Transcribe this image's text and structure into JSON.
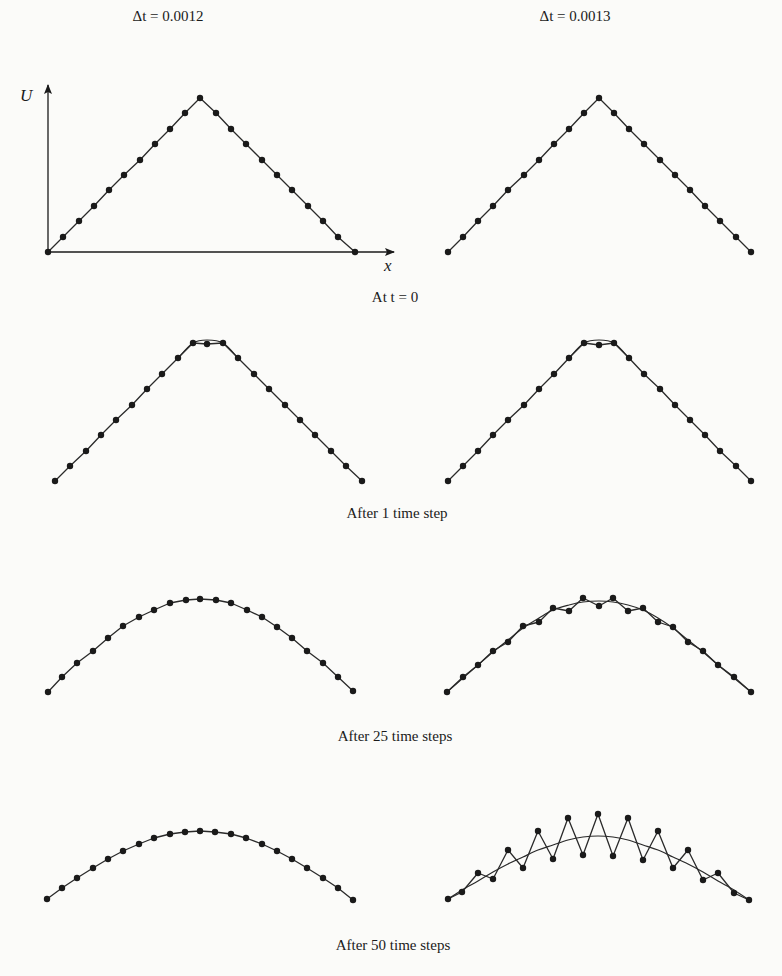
{
  "headers": {
    "left": "Δt = 0.0012",
    "right": "Δt = 0.0013"
  },
  "axes": {
    "y_label": "U",
    "x_label": "x"
  },
  "captions": {
    "row0": "At t = 0",
    "row1": "After 1 time step",
    "row2": "After 25 time steps",
    "row3": "After 50 time steps"
  },
  "chart_data": {
    "type": "line",
    "xlabel": "x",
    "ylabel": "U",
    "grid": false,
    "columns": [
      "Δt = 0.0012",
      "Δt = 0.0013"
    ],
    "rows": [
      "At t = 0",
      "After 1 time step",
      "After 25 time steps",
      "After 50 time steps"
    ],
    "panels": [
      {
        "row": 0,
        "col": 0,
        "name": "t0-stable",
        "axes": true,
        "points": [
          [
            48,
            252
          ],
          [
            63,
            237
          ],
          [
            79,
            221
          ],
          [
            94,
            206
          ],
          [
            109,
            190
          ],
          [
            124,
            175
          ],
          [
            140,
            160
          ],
          [
            155,
            144
          ],
          [
            170,
            129
          ],
          [
            185,
            113
          ],
          [
            200,
            98
          ],
          [
            216,
            113
          ],
          [
            231,
            129
          ],
          [
            246,
            144
          ],
          [
            262,
            160
          ],
          [
            277,
            175
          ],
          [
            292,
            190
          ],
          [
            308,
            206
          ],
          [
            323,
            221
          ],
          [
            338,
            237
          ],
          [
            355,
            252
          ]
        ],
        "smooth": null
      },
      {
        "row": 0,
        "col": 1,
        "name": "t0-unstable",
        "axes": false,
        "points": [
          [
            448,
            252
          ],
          [
            463,
            237
          ],
          [
            478,
            221
          ],
          [
            493,
            206
          ],
          [
            508,
            190
          ],
          [
            524,
            175
          ],
          [
            539,
            160
          ],
          [
            554,
            144
          ],
          [
            569,
            129
          ],
          [
            584,
            113
          ],
          [
            599,
            98
          ],
          [
            614,
            113
          ],
          [
            629,
            129
          ],
          [
            644,
            144
          ],
          [
            660,
            160
          ],
          [
            675,
            175
          ],
          [
            690,
            190
          ],
          [
            705,
            206
          ],
          [
            720,
            221
          ],
          [
            736,
            237
          ],
          [
            751,
            252
          ]
        ],
        "smooth": null
      },
      {
        "row": 1,
        "col": 0,
        "name": "step1-stable",
        "axes": false,
        "points": [
          [
            55,
            481
          ],
          [
            70,
            466
          ],
          [
            86,
            451
          ],
          [
            101,
            435
          ],
          [
            116,
            420
          ],
          [
            132,
            405
          ],
          [
            147,
            389
          ],
          [
            162,
            374
          ],
          [
            178,
            358
          ],
          [
            193,
            343
          ],
          [
            207,
            344
          ],
          [
            223,
            343
          ],
          [
            238,
            358
          ],
          [
            254,
            374
          ],
          [
            269,
            389
          ],
          [
            285,
            405
          ],
          [
            300,
            420
          ],
          [
            315,
            435
          ],
          [
            331,
            451
          ],
          [
            346,
            466
          ],
          [
            362,
            481
          ]
        ],
        "smooth": [
          [
            178,
            358
          ],
          [
            193,
            343
          ],
          [
            207,
            340
          ],
          [
            223,
            343
          ],
          [
            238,
            358
          ]
        ]
      },
      {
        "row": 1,
        "col": 1,
        "name": "step1-unstable",
        "axes": false,
        "points": [
          [
            448,
            481
          ],
          [
            463,
            466
          ],
          [
            478,
            451
          ],
          [
            493,
            435
          ],
          [
            508,
            420
          ],
          [
            524,
            405
          ],
          [
            539,
            389
          ],
          [
            554,
            374
          ],
          [
            569,
            358
          ],
          [
            584,
            343
          ],
          [
            599,
            345
          ],
          [
            614,
            343
          ],
          [
            629,
            358
          ],
          [
            644,
            374
          ],
          [
            660,
            389
          ],
          [
            675,
            405
          ],
          [
            690,
            420
          ],
          [
            705,
            435
          ],
          [
            720,
            451
          ],
          [
            736,
            466
          ],
          [
            751,
            481
          ]
        ],
        "smooth": [
          [
            569,
            358
          ],
          [
            584,
            343
          ],
          [
            599,
            340
          ],
          [
            614,
            343
          ],
          [
            629,
            358
          ]
        ]
      },
      {
        "row": 2,
        "col": 0,
        "name": "step25-stable",
        "axes": false,
        "points": [
          [
            48,
            692
          ],
          [
            62,
            677
          ],
          [
            77,
            663
          ],
          [
            93,
            651
          ],
          [
            108,
            638
          ],
          [
            123,
            626
          ],
          [
            139,
            617
          ],
          [
            154,
            610
          ],
          [
            170,
            603
          ],
          [
            186,
            600
          ],
          [
            200,
            599
          ],
          [
            216,
            600
          ],
          [
            231,
            603
          ],
          [
            247,
            610
          ],
          [
            262,
            617
          ],
          [
            277,
            627
          ],
          [
            292,
            638
          ],
          [
            307,
            651
          ],
          [
            323,
            663
          ],
          [
            338,
            677
          ],
          [
            353,
            691
          ]
        ],
        "smooth": null
      },
      {
        "row": 2,
        "col": 1,
        "name": "step25-unstable",
        "axes": false,
        "points": [
          [
            447,
            692
          ],
          [
            463,
            677
          ],
          [
            478,
            665
          ],
          [
            493,
            651
          ],
          [
            508,
            642
          ],
          [
            523,
            626
          ],
          [
            539,
            622
          ],
          [
            553,
            608
          ],
          [
            569,
            611
          ],
          [
            583,
            598
          ],
          [
            599,
            606
          ],
          [
            613,
            598
          ],
          [
            628,
            611
          ],
          [
            643,
            608
          ],
          [
            658,
            622
          ],
          [
            673,
            627
          ],
          [
            688,
            642
          ],
          [
            703,
            651
          ],
          [
            718,
            665
          ],
          [
            734,
            677
          ],
          [
            751,
            692
          ]
        ],
        "smooth": [
          [
            447,
            692
          ],
          [
            463,
            678
          ],
          [
            478,
            665
          ],
          [
            493,
            652
          ],
          [
            508,
            640
          ],
          [
            523,
            628
          ],
          [
            539,
            618
          ],
          [
            553,
            610
          ],
          [
            569,
            605
          ],
          [
            583,
            602
          ],
          [
            599,
            601
          ],
          [
            613,
            602
          ],
          [
            628,
            605
          ],
          [
            643,
            610
          ],
          [
            658,
            618
          ],
          [
            673,
            628
          ],
          [
            688,
            640
          ],
          [
            703,
            652
          ],
          [
            718,
            665
          ],
          [
            734,
            678
          ],
          [
            751,
            692
          ]
        ]
      },
      {
        "row": 3,
        "col": 0,
        "name": "step50-stable",
        "axes": false,
        "points": [
          [
            47,
            899
          ],
          [
            62,
            888
          ],
          [
            77,
            878
          ],
          [
            93,
            868
          ],
          [
            108,
            859
          ],
          [
            123,
            851
          ],
          [
            139,
            844
          ],
          [
            154,
            838
          ],
          [
            170,
            834
          ],
          [
            185,
            832
          ],
          [
            200,
            831
          ],
          [
            215,
            832
          ],
          [
            231,
            834
          ],
          [
            246,
            838
          ],
          [
            262,
            844
          ],
          [
            277,
            851
          ],
          [
            292,
            859
          ],
          [
            307,
            868
          ],
          [
            323,
            878
          ],
          [
            338,
            888
          ],
          [
            353,
            900
          ]
        ],
        "smooth": null
      },
      {
        "row": 3,
        "col": 1,
        "name": "step50-unstable",
        "axes": false,
        "points": [
          [
            448,
            899
          ],
          [
            462,
            892
          ],
          [
            478,
            873
          ],
          [
            493,
            879
          ],
          [
            508,
            850
          ],
          [
            523,
            868
          ],
          [
            538,
            831
          ],
          [
            553,
            859
          ],
          [
            568,
            818
          ],
          [
            583,
            855
          ],
          [
            598,
            814
          ],
          [
            613,
            856
          ],
          [
            628,
            818
          ],
          [
            643,
            860
          ],
          [
            658,
            831
          ],
          [
            673,
            868
          ],
          [
            688,
            850
          ],
          [
            703,
            880
          ],
          [
            718,
            873
          ],
          [
            734,
            893
          ],
          [
            749,
            900
          ]
        ],
        "smooth": [
          [
            448,
            899
          ],
          [
            462,
            890
          ],
          [
            478,
            881
          ],
          [
            493,
            872
          ],
          [
            508,
            864
          ],
          [
            523,
            857
          ],
          [
            538,
            850
          ],
          [
            553,
            845
          ],
          [
            568,
            840
          ],
          [
            583,
            837
          ],
          [
            598,
            836
          ],
          [
            613,
            837
          ],
          [
            628,
            840
          ],
          [
            643,
            845
          ],
          [
            658,
            850
          ],
          [
            673,
            857
          ],
          [
            688,
            864
          ],
          [
            703,
            872
          ],
          [
            718,
            881
          ],
          [
            734,
            890
          ],
          [
            749,
            900
          ]
        ]
      }
    ],
    "axis_lines": {
      "y_axis": [
        [
          48,
          252
        ],
        [
          48,
          85
        ]
      ],
      "x_axis": [
        [
          48,
          252
        ],
        [
          394,
          252
        ]
      ]
    },
    "colors": {
      "line": "#2a2a2a",
      "marker": "#1a1a1a",
      "background": "#fbfbf9"
    }
  }
}
